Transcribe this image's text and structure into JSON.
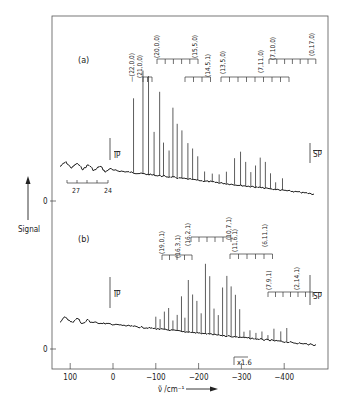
{
  "figure": {
    "panel_a_label": "(a)",
    "panel_b_label": "(b)",
    "y_axis_label": "Signal",
    "x_axis_label": "ν̃ /cm⁻¹",
    "zero_label": "0",
    "ip_label": "IP",
    "sp_label": "SP",
    "scale_note": "x1.6",
    "inset_ticks": [
      "27",
      "24"
    ]
  },
  "chart_data": [
    {
      "type": "line",
      "panel": "(a)",
      "title": "(a)",
      "xlabel": "ν̃ /cm⁻¹",
      "ylabel": "Signal",
      "xlim": [
        140,
        -480
      ],
      "xticks": [
        100,
        0,
        -100,
        -200,
        -300,
        -400
      ],
      "markers": {
        "IP": 0,
        "SP": -470
      },
      "inset_scale_ticks": [
        "27",
        "24"
      ],
      "progressions": [
        {
          "label": "(22,0,0)",
          "x_start": -48
        },
        {
          "label": "(21,0,0)",
          "x_start": -70,
          "spacing": 13,
          "count": 3
        },
        {
          "label": "(20,0,0)",
          "x_start": -88,
          "spacing": 19,
          "count": 6
        },
        {
          "label": "(15,5,0)",
          "x_start": -184
        },
        {
          "label": "(14,5,1)",
          "x_start": -184,
          "spacing": 19,
          "count": 4
        },
        {
          "label": "(13,5,0)",
          "x_start": -254,
          "spacing": 19,
          "count": 9
        },
        {
          "label": "(7,11,0)",
          "x_start": -395
        },
        {
          "label": "(7,10,0)",
          "x_start": -300,
          "spacing": 19,
          "count": 7
        },
        {
          "label": "(0,17,0)",
          "x_start": -418
        }
      ],
      "peaks": [
        {
          "x": -48,
          "h": 0.62
        },
        {
          "x": -70,
          "h": 0.86
        },
        {
          "x": -83,
          "h": 0.82
        },
        {
          "x": -96,
          "h": 0.36
        },
        {
          "x": -109,
          "h": 0.7
        },
        {
          "x": -118,
          "h": 0.28
        },
        {
          "x": -131,
          "h": 0.22
        },
        {
          "x": -140,
          "h": 0.58
        },
        {
          "x": -150,
          "h": 0.45
        },
        {
          "x": -161,
          "h": 0.4
        },
        {
          "x": -175,
          "h": 0.3
        },
        {
          "x": -186,
          "h": 0.26
        },
        {
          "x": -198,
          "h": 0.2
        },
        {
          "x": -214,
          "h": 0.08
        },
        {
          "x": -232,
          "h": 0.07
        },
        {
          "x": -248,
          "h": 0.07
        },
        {
          "x": -265,
          "h": 0.1
        },
        {
          "x": -284,
          "h": 0.22
        },
        {
          "x": -298,
          "h": 0.28
        },
        {
          "x": -310,
          "h": 0.2
        },
        {
          "x": -322,
          "h": 0.12
        },
        {
          "x": -333,
          "h": 0.18
        },
        {
          "x": -344,
          "h": 0.25
        },
        {
          "x": -356,
          "h": 0.22
        },
        {
          "x": -368,
          "h": 0.13
        },
        {
          "x": -380,
          "h": 0.06
        },
        {
          "x": -396,
          "h": 0.1
        }
      ]
    },
    {
      "type": "line",
      "panel": "(b)",
      "title": "(b)",
      "xlabel": "ν̃ /cm⁻¹",
      "ylabel": "Signal",
      "xlim": [
        140,
        -480
      ],
      "xticks": [
        100,
        0,
        -100,
        -200,
        -300,
        -400
      ],
      "markers": {
        "IP": 0,
        "SP": -470
      },
      "scale_change": {
        "label": "x1.6",
        "x": -290
      },
      "progressions": [
        {
          "label": "(19,0,1)",
          "x_start": -130,
          "spacing": 14,
          "count": 5
        },
        {
          "label": "(16,3,1)",
          "x_start": -158
        },
        {
          "label": "(16,2,1)",
          "x_start": -172,
          "spacing": 16,
          "count": 6
        },
        {
          "label": "(10,7,1)",
          "x_start": -260
        },
        {
          "label": "(11,6,1)",
          "x_start": -262,
          "spacing": 16,
          "count": 8
        },
        {
          "label": "(6,11,1)",
          "x_start": -350
        },
        {
          "label": "(7,9,1)",
          "x_start": -370,
          "spacing": 16,
          "count": 8
        },
        {
          "label": "(2,14,1)",
          "x_start": -430
        }
      ],
      "peaks": [
        {
          "x": -100,
          "h": 0.12
        },
        {
          "x": -110,
          "h": 0.1
        },
        {
          "x": -120,
          "h": 0.18
        },
        {
          "x": -130,
          "h": 0.22
        },
        {
          "x": -140,
          "h": 0.1
        },
        {
          "x": -150,
          "h": 0.16
        },
        {
          "x": -160,
          "h": 0.35
        },
        {
          "x": -168,
          "h": 0.14
        },
        {
          "x": -176,
          "h": 0.52
        },
        {
          "x": -186,
          "h": 0.38
        },
        {
          "x": -196,
          "h": 0.32
        },
        {
          "x": -206,
          "h": 0.2
        },
        {
          "x": -216,
          "h": 0.7
        },
        {
          "x": -226,
          "h": 0.58
        },
        {
          "x": -236,
          "h": 0.26
        },
        {
          "x": -246,
          "h": 0.2
        },
        {
          "x": -256,
          "h": 0.48
        },
        {
          "x": -266,
          "h": 0.6
        },
        {
          "x": -276,
          "h": 0.5
        },
        {
          "x": -286,
          "h": 0.42
        },
        {
          "x": -296,
          "h": 0.28
        },
        {
          "x": -306,
          "h": 0.06
        },
        {
          "x": -320,
          "h": 0.08
        },
        {
          "x": -334,
          "h": 0.06
        },
        {
          "x": -348,
          "h": 0.08
        },
        {
          "x": -362,
          "h": 0.05
        },
        {
          "x": -376,
          "h": 0.12
        },
        {
          "x": -392,
          "h": 0.1
        },
        {
          "x": -406,
          "h": 0.14
        }
      ]
    }
  ]
}
